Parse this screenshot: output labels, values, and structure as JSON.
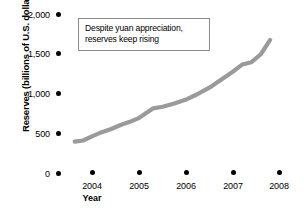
{
  "chart_data": {
    "type": "line",
    "title": "",
    "xlabel": "Year",
    "ylabel": "Reserves (billions of U.S. dollars)",
    "xlim": [
      2003.6,
      2008.0
    ],
    "ylim": [
      0,
      2000
    ],
    "ytick_labels": [
      "2,000",
      "1,500",
      "1,000",
      "500",
      "0"
    ],
    "ytick_values": [
      2000,
      1500,
      1000,
      500,
      0
    ],
    "xtick_labels": [
      "2004",
      "2005",
      "2006",
      "2007",
      "2008"
    ],
    "xtick_values": [
      2004,
      2005,
      2006,
      2007,
      2008
    ],
    "grid": false,
    "legend": "none",
    "line_color": "#9a9a9a",
    "series": [
      {
        "name": "Reserves",
        "x": [
          2003.62,
          2003.8,
          2004.0,
          2004.2,
          2004.4,
          2004.6,
          2004.8,
          2005.0,
          2005.15,
          2005.3,
          2005.5,
          2005.75,
          2006.0,
          2006.25,
          2006.5,
          2006.75,
          2007.0,
          2007.2,
          2007.4,
          2007.6,
          2007.8
        ],
        "y": [
          400,
          415,
          470,
          520,
          560,
          610,
          650,
          700,
          760,
          820,
          840,
          880,
          930,
          1000,
          1080,
          1180,
          1280,
          1370,
          1400,
          1500,
          1680
        ]
      }
    ],
    "annotations": [
      {
        "name": "callout",
        "lines": [
          "Despite yuan appreciation,",
          "reserves keep rising"
        ]
      }
    ]
  },
  "axis": {
    "y_title": "Reserves (billions of U.S. dollars)",
    "x_title": "Year"
  }
}
